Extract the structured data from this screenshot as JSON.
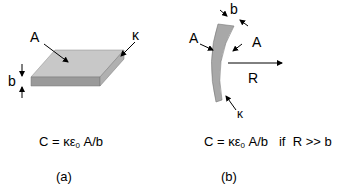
{
  "panel_a": {
    "labels": {
      "area": "A",
      "dielectric": "κ",
      "thickness": "b"
    },
    "equation": {
      "lhs": "C = κε",
      "sub": "0",
      "rhs": " A/b"
    },
    "caption": "(a)"
  },
  "panel_b": {
    "labels": {
      "area_left": "A",
      "area_right": "A",
      "thickness": "b",
      "radius": "R",
      "dielectric": "κ"
    },
    "equation": {
      "lhs": "C = κε",
      "sub": "0",
      "rhs": " A/b   if  R >> b"
    },
    "caption": "(b)"
  },
  "colors": {
    "plate_top": "#c8c8c8",
    "plate_front": "#9a9a9a",
    "plate_side": "#b0b0b0",
    "curved_plate": "#a8a8a8"
  }
}
